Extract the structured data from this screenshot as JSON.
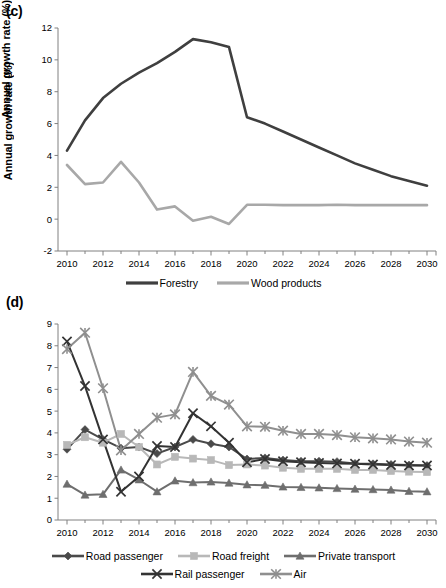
{
  "figure": {
    "panels": [
      {
        "id": "c",
        "label": "(c)",
        "ylabel": "Annual growth rate (%)"
      },
      {
        "id": "d",
        "label": "(d)",
        "ylabel": "Annual growth rate (%)"
      }
    ]
  },
  "colors": {
    "dark": "#3f3f3f",
    "mid_dark": "#555555",
    "mid": "#6f6f6f",
    "light": "#a8a8a8",
    "lighter": "#c0c0c0",
    "axis": "#808080",
    "text": "#000000"
  },
  "chart_data": [
    {
      "type": "line",
      "panel": "c",
      "title": "(c)",
      "xlabel": "",
      "ylabel": "Annual growth rate (%)",
      "xlim": [
        2009.5,
        2030.5
      ],
      "ylim": [
        -2,
        12
      ],
      "yticks": [
        -2,
        0,
        2,
        4,
        6,
        8,
        10,
        12
      ],
      "xticks": [
        2010,
        2012,
        2014,
        2016,
        2018,
        2020,
        2022,
        2024,
        2026,
        2028,
        2030
      ],
      "x": [
        2010,
        2011,
        2012,
        2013,
        2014,
        2015,
        2016,
        2017,
        2018,
        2019,
        2020,
        2021,
        2022,
        2023,
        2024,
        2025,
        2026,
        2027,
        2028,
        2029,
        2030
      ],
      "grid": false,
      "legend_position": "bottom",
      "series": [
        {
          "name": "Forestry",
          "color": "#3f3f3f",
          "marker": "none",
          "values": [
            4.3,
            6.2,
            7.6,
            8.5,
            9.2,
            9.8,
            10.5,
            11.3,
            11.1,
            10.8,
            6.4,
            6.0,
            5.5,
            5.0,
            4.5,
            4.0,
            3.5,
            3.1,
            2.7,
            2.4,
            2.1
          ]
        },
        {
          "name": "Wood products",
          "color": "#a8a8a8",
          "marker": "none",
          "values": [
            3.4,
            2.2,
            2.3,
            3.6,
            2.3,
            0.6,
            0.8,
            -0.1,
            0.15,
            -0.3,
            0.9,
            0.9,
            0.88,
            0.88,
            0.88,
            0.9,
            0.88,
            0.88,
            0.88,
            0.88,
            0.88
          ]
        }
      ]
    },
    {
      "type": "line",
      "panel": "d",
      "title": "(d)",
      "xlabel": "",
      "ylabel": "Annual growth rate (%)",
      "xlim": [
        2009.5,
        2030.5
      ],
      "ylim": [
        0,
        9
      ],
      "yticks": [
        0,
        1,
        2,
        3,
        4,
        5,
        6,
        7,
        8,
        9
      ],
      "xticks": [
        2010,
        2012,
        2014,
        2016,
        2018,
        2020,
        2022,
        2024,
        2026,
        2028,
        2030
      ],
      "x": [
        2010,
        2011,
        2012,
        2013,
        2014,
        2015,
        2016,
        2017,
        2018,
        2019,
        2020,
        2021,
        2022,
        2023,
        2024,
        2025,
        2026,
        2027,
        2028,
        2029,
        2030
      ],
      "grid": false,
      "legend_position": "bottom",
      "series": [
        {
          "name": "Road passenger",
          "color": "#4a4a4a",
          "marker": "diamond",
          "values": [
            3.25,
            4.15,
            3.7,
            3.3,
            3.35,
            3.05,
            3.35,
            3.7,
            3.5,
            3.35,
            2.8,
            2.85,
            2.75,
            2.7,
            2.7,
            2.68,
            2.6,
            2.58,
            2.55,
            2.52,
            2.5
          ]
        },
        {
          "name": "Road freight",
          "color": "#b8b8b8",
          "marker": "square",
          "values": [
            3.45,
            3.8,
            3.55,
            3.95,
            3.35,
            2.55,
            2.9,
            2.82,
            2.75,
            2.52,
            2.55,
            2.5,
            2.4,
            2.35,
            2.35,
            2.35,
            2.3,
            2.3,
            2.25,
            2.22,
            2.2
          ]
        },
        {
          "name": "Private transport",
          "color": "#6e6e6e",
          "marker": "triangle",
          "values": [
            1.65,
            1.15,
            1.18,
            2.3,
            1.85,
            1.3,
            1.8,
            1.72,
            1.75,
            1.7,
            1.62,
            1.6,
            1.52,
            1.5,
            1.48,
            1.45,
            1.42,
            1.4,
            1.38,
            1.32,
            1.3
          ]
        },
        {
          "name": "Rail passenger",
          "color": "#333333",
          "marker": "cross",
          "values": [
            8.2,
            6.15,
            3.7,
            1.3,
            2.0,
            3.4,
            3.35,
            4.9,
            4.3,
            3.55,
            2.65,
            2.8,
            2.7,
            2.65,
            2.62,
            2.6,
            2.58,
            2.55,
            2.52,
            2.5,
            2.5
          ]
        },
        {
          "name": "Air",
          "color": "#8f8f8f",
          "marker": "asterisk",
          "values": [
            7.85,
            8.6,
            6.05,
            3.2,
            3.95,
            4.7,
            4.85,
            6.8,
            5.7,
            5.3,
            4.3,
            4.28,
            4.1,
            3.95,
            3.95,
            3.9,
            3.8,
            3.75,
            3.7,
            3.6,
            3.55
          ]
        }
      ]
    }
  ],
  "legends": {
    "c": [
      {
        "label": "Forestry",
        "color": "#3f3f3f",
        "marker": "none"
      },
      {
        "label": "Wood products",
        "color": "#a8a8a8",
        "marker": "none"
      }
    ],
    "d": [
      {
        "label": "Road passenger",
        "color": "#4a4a4a",
        "marker": "diamond"
      },
      {
        "label": "Road freight",
        "color": "#b8b8b8",
        "marker": "square"
      },
      {
        "label": "Private transport",
        "color": "#6e6e6e",
        "marker": "triangle"
      },
      {
        "label": "Rail passenger",
        "color": "#333333",
        "marker": "cross"
      },
      {
        "label": "Air",
        "color": "#8f8f8f",
        "marker": "asterisk"
      }
    ]
  }
}
